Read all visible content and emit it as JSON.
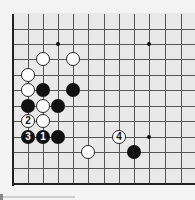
{
  "board": {
    "description": "Partial Go board diagram (lower-left corner region)",
    "colors": {
      "background": "#e9e9e9",
      "margin": "#f4f4f4",
      "line": "#555555",
      "edge": "#222222",
      "black": "#111111",
      "white": "#ffffff"
    },
    "columns_x": [
      13,
      28,
      43,
      58,
      73,
      88,
      104,
      119,
      134,
      149,
      165,
      181
    ],
    "rows_y": [
      14,
      29,
      44,
      59,
      75,
      90,
      106,
      121,
      137,
      152,
      168,
      184
    ],
    "star_points": [
      {
        "col": 3,
        "row": 2
      },
      {
        "col": 9,
        "row": 2
      },
      {
        "col": 9,
        "row": 8
      }
    ],
    "stones": [
      {
        "color": "white",
        "col": 2,
        "row": 3,
        "label": ""
      },
      {
        "color": "white",
        "col": 4,
        "row": 3,
        "label": ""
      },
      {
        "color": "white",
        "col": 1,
        "row": 4,
        "label": ""
      },
      {
        "color": "white",
        "col": 1,
        "row": 5,
        "label": ""
      },
      {
        "color": "black",
        "col": 2,
        "row": 5,
        "label": ""
      },
      {
        "color": "black",
        "col": 4,
        "row": 5,
        "label": ""
      },
      {
        "color": "black",
        "col": 1,
        "row": 6,
        "label": ""
      },
      {
        "color": "white",
        "col": 2,
        "row": 6,
        "label": ""
      },
      {
        "color": "black",
        "col": 3,
        "row": 6,
        "label": ""
      },
      {
        "color": "white",
        "col": 1,
        "row": 7,
        "label": "2"
      },
      {
        "color": "white",
        "col": 2,
        "row": 7,
        "label": ""
      },
      {
        "color": "black",
        "col": 1,
        "row": 8,
        "label": "3"
      },
      {
        "color": "black",
        "col": 2,
        "row": 8,
        "label": "1"
      },
      {
        "color": "black",
        "col": 3,
        "row": 8,
        "label": ""
      },
      {
        "color": "white",
        "col": 7,
        "row": 8,
        "label": "4"
      },
      {
        "color": "white",
        "col": 5,
        "row": 9,
        "label": ""
      },
      {
        "color": "black",
        "col": 8,
        "row": 9,
        "label": ""
      }
    ]
  }
}
